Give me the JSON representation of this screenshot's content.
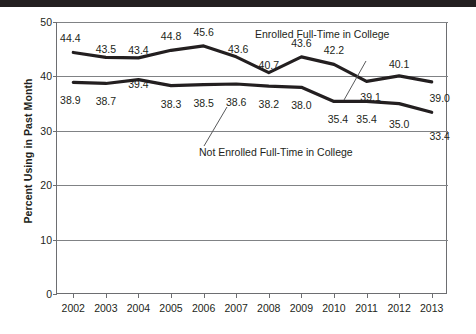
{
  "chart_data": {
    "type": "line",
    "title": "",
    "xlabel": "",
    "ylabel": "Percent Using in Past Month",
    "categories": [
      "2002",
      "2003",
      "2004",
      "2005",
      "2006",
      "2007",
      "2008",
      "2009",
      "2010",
      "2011",
      "2012",
      "2013"
    ],
    "ylim": [
      0,
      50
    ],
    "yticks": [
      0,
      10,
      20,
      30,
      40,
      50
    ],
    "ytick_labels": [
      "0",
      "10",
      "20",
      "30",
      "40",
      "50"
    ],
    "grid": "horizontal",
    "legend_position": "inline-annotations",
    "series": [
      {
        "name": "Enrolled Full-Time in College",
        "values": [
          44.4,
          43.5,
          43.4,
          44.8,
          45.6,
          43.6,
          40.7,
          43.6,
          42.2,
          39.1,
          40.1,
          39.0
        ],
        "labels": [
          "44.4",
          "43.5",
          "43.4",
          "44.8",
          "45.6",
          "43.6",
          "40.7",
          "43.6",
          "42.2",
          "39.1",
          "40.1",
          "39.0"
        ],
        "color": "#231f20"
      },
      {
        "name": "Not Enrolled Full-Time in College",
        "values": [
          38.9,
          38.7,
          39.4,
          38.3,
          38.5,
          38.6,
          38.2,
          38.0,
          35.4,
          35.4,
          35.0,
          33.4
        ],
        "labels": [
          "38.9",
          "38.7",
          "39.4",
          "38.3",
          "38.5",
          "38.6",
          "38.2",
          "38.0",
          "35.4",
          "35.4",
          "35.0",
          "33.4"
        ],
        "color": "#231f20"
      }
    ],
    "annotations": [
      {
        "text": "Enrolled Full-Time in College"
      },
      {
        "text": "Not Enrolled Full-Time in College"
      }
    ],
    "colors": {
      "line": "#231f20",
      "axis": "#6d6e71",
      "grid": "#808285",
      "top_rule": "#231f20",
      "background": "#ffffff"
    }
  }
}
